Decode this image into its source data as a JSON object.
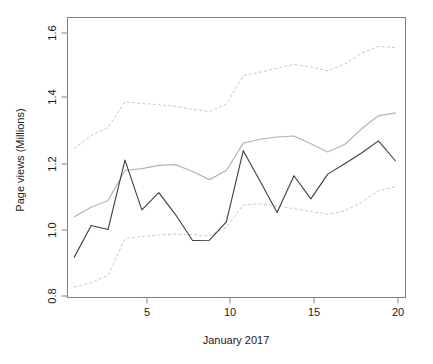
{
  "chart_data": {
    "type": "line",
    "title": "",
    "xlabel": "January 2017",
    "ylabel": "Page views (Millions)",
    "xlim": [
      0.6,
      20.6
    ],
    "ylim": [
      0.77,
      1.63
    ],
    "xticks": [
      5,
      10,
      15,
      20
    ],
    "xtick_labels": [
      "5",
      "10",
      "15",
      "20"
    ],
    "yticks": [
      0.8,
      1.0,
      1.2,
      1.4,
      1.6
    ],
    "ytick_labels": [
      "0.8",
      "1.0",
      "1.2",
      "1.4",
      "1.6"
    ],
    "grid": false,
    "legend": "none",
    "x": [
      1,
      2,
      3,
      4,
      5,
      6,
      7,
      8,
      9,
      10,
      11,
      12,
      13,
      14,
      15,
      16,
      17,
      18,
      19,
      20
    ],
    "series": [
      {
        "name": "Observed page views",
        "style": "solid",
        "color": "#3c3c46",
        "values": [
          0.894,
          0.991,
          0.979,
          1.192,
          1.039,
          1.092,
          1.024,
          0.945,
          0.946,
          1.002,
          1.221,
          1.127,
          1.031,
          1.144,
          1.073,
          1.149,
          1.181,
          1.214,
          1.251,
          1.19
        ]
      },
      {
        "name": "Fitted / expected level",
        "style": "solid",
        "color": "#b4b4b4",
        "values": [
          1.018,
          1.047,
          1.068,
          1.16,
          1.166,
          1.176,
          1.178,
          1.157,
          1.132,
          1.16,
          1.244,
          1.256,
          1.263,
          1.266,
          1.242,
          1.217,
          1.24,
          1.288,
          1.328,
          1.337
        ]
      },
      {
        "name": "Upper bound",
        "style": "dashed",
        "color": "#c8c8c8",
        "values": [
          1.227,
          1.268,
          1.292,
          1.371,
          1.366,
          1.362,
          1.357,
          1.348,
          1.341,
          1.364,
          1.451,
          1.462,
          1.474,
          1.486,
          1.478,
          1.466,
          1.487,
          1.52,
          1.541,
          1.538
        ]
      },
      {
        "name": "Lower bound",
        "style": "dashed",
        "color": "#c8c8c8",
        "values": [
          0.802,
          0.816,
          0.838,
          0.951,
          0.957,
          0.962,
          0.965,
          0.963,
          0.959,
          0.985,
          1.054,
          1.058,
          1.051,
          1.043,
          1.034,
          1.026,
          1.036,
          1.062,
          1.098,
          1.11
        ]
      }
    ]
  },
  "axes": {
    "ylabel": "Page views (Millions)",
    "xlabel": "January 2017",
    "ytick_0": "0.8",
    "ytick_1": "1.0",
    "ytick_2": "1.2",
    "ytick_3": "1.4",
    "ytick_4": "1.6",
    "xtick_0": "5",
    "xtick_1": "10",
    "xtick_2": "15",
    "xtick_3": "20"
  }
}
